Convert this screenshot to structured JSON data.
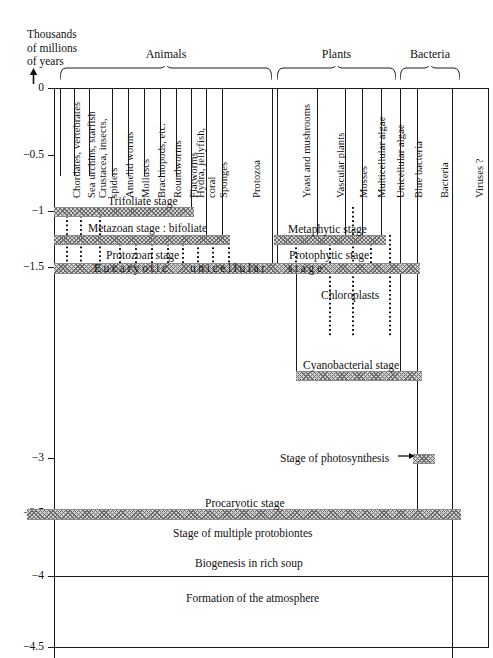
{
  "figure": {
    "axis_caption_lines": [
      "Thousands",
      "of millions",
      "of years"
    ],
    "y_ticks": [
      {
        "label": "0",
        "y": 88
      },
      {
        "label": "−0.5",
        "y": 155
      },
      {
        "label": "−1",
        "y": 211
      },
      {
        "label": "−1.5",
        "y": 267
      },
      {
        "label": "−3",
        "y": 458
      },
      {
        "label": "−3.5",
        "y": 513
      },
      {
        "label": "−4",
        "y": 576
      },
      {
        "label": "−4.5",
        "y": 647
      }
    ],
    "groups": [
      {
        "title": "Animals",
        "left": 60,
        "right": 272
      },
      {
        "title": "Plants",
        "left": 277,
        "right": 396
      },
      {
        "title": "Bacteria",
        "left": 400,
        "right": 460
      }
    ],
    "columns": [
      {
        "label": "Chordates, vertebrates",
        "x0": 60,
        "x1": 74
      },
      {
        "label": "Sea urchins, starfish",
        "x0": 74,
        "x1": 89
      },
      {
        "label": "Crustacea, insects, spiders",
        "x0": 89,
        "x1": 112
      },
      {
        "label": "Annelid worms",
        "x0": 112,
        "x1": 128
      },
      {
        "label": "Molluscs",
        "x0": 128,
        "x1": 144
      },
      {
        "label": "Brachiopods, etc.",
        "x0": 144,
        "x1": 160
      },
      {
        "label": "Roundworms",
        "x0": 160,
        "x1": 176
      },
      {
        "label": "Flatworms",
        "x0": 176,
        "x1": 191
      },
      {
        "label": "Hydra, jellyfish, coral",
        "x0": 191,
        "x1": 206
      },
      {
        "label": "Sponges",
        "x0": 206,
        "x1": 222
      },
      {
        "label": "Protozoa",
        "x0": 222,
        "x1": 272
      },
      {
        "label": "Yeast and mushrooms",
        "x0": 277,
        "x1": 317
      },
      {
        "label": "Vascular plants",
        "x0": 317,
        "x1": 345
      },
      {
        "label": "Mosses",
        "x0": 345,
        "x1": 362
      },
      {
        "label": "Multicellular algae",
        "x0": 362,
        "x1": 381
      },
      {
        "label": "Unicellular algae",
        "x0": 381,
        "x1": 400
      },
      {
        "label": "Blue bacteria",
        "x0": 400,
        "x1": 417
      },
      {
        "label": "Bacteria",
        "x0": 417,
        "x1": 452
      },
      {
        "label": "Viruses ?",
        "x0": 452,
        "x1": 488
      }
    ],
    "bands": [
      {
        "name": "trifoliate-base",
        "left": 54,
        "width": 140,
        "top": 207,
        "height": 8
      },
      {
        "name": "metazoan-base",
        "left": 54,
        "width": 176,
        "top": 235,
        "height": 8
      },
      {
        "name": "metaphytic-base",
        "left": 274,
        "width": 112,
        "top": 235,
        "height": 8
      },
      {
        "name": "eucaryotic-base",
        "left": 54,
        "width": 366,
        "top": 263,
        "height": 9
      },
      {
        "name": "cyanobacterial-base",
        "left": 296,
        "width": 126,
        "top": 371,
        "height": 8
      },
      {
        "name": "photosynthesis-tip",
        "left": 413,
        "width": 22,
        "top": 454,
        "height": 8
      },
      {
        "name": "procaryotic-base",
        "left": 27,
        "width": 434,
        "top": 509,
        "height": 9
      }
    ],
    "stage_labels": [
      {
        "text": "Trifoliate stage",
        "x": 108,
        "y": 195,
        "spaced": false
      },
      {
        "text": "Metazoan stage : bifoliate",
        "x": 88,
        "y": 222,
        "spaced": false
      },
      {
        "text": "Protozoan stage",
        "x": 106,
        "y": 249,
        "spaced": false
      },
      {
        "text": "Eucaryotic",
        "x": 94,
        "y": 262,
        "spaced": true
      },
      {
        "text": "unicellular",
        "x": 190,
        "y": 262,
        "spaced": true
      },
      {
        "text": "stage",
        "x": 288,
        "y": 262,
        "spaced": true
      },
      {
        "text": "Metaphytic stage",
        "x": 288,
        "y": 223,
        "spaced": false
      },
      {
        "text": "Protophytic stage",
        "x": 289,
        "y": 249,
        "spaced": false
      },
      {
        "text": "Chloroplasts",
        "x": 321,
        "y": 289,
        "spaced": false
      },
      {
        "text": "Cyanobacterial stage",
        "x": 303,
        "y": 359,
        "spaced": false
      },
      {
        "text": "Stage of photosynthesis",
        "x": 280,
        "y": 452,
        "spaced": false
      },
      {
        "text": "Procaryotic stage",
        "x": 205,
        "y": 497,
        "spaced": false
      },
      {
        "text": "Stage of multiple protobiontes",
        "x": 173,
        "y": 527,
        "spaced": false
      },
      {
        "text": "Biogenesis in rich soup",
        "x": 195,
        "y": 557,
        "spaced": false
      },
      {
        "text": "Formation of the atmosphere",
        "x": 186,
        "y": 592,
        "spaced": false
      }
    ],
    "lineages": [
      {
        "name": "chordates",
        "x": 67,
        "top": 207,
        "bottom": 272
      },
      {
        "name": "seaurchins",
        "x": 81,
        "top": 207,
        "bottom": 272
      },
      {
        "name": "crustacea",
        "x": 100,
        "top": 207,
        "bottom": 272
      },
      {
        "name": "annelid",
        "x": 120,
        "top": 235,
        "bottom": 272
      },
      {
        "name": "molluscs",
        "x": 136,
        "top": 235,
        "bottom": 272
      },
      {
        "name": "brachiopods",
        "x": 152,
        "top": 235,
        "bottom": 272
      },
      {
        "name": "roundworms",
        "x": 168,
        "top": 235,
        "bottom": 272
      },
      {
        "name": "flatworms",
        "x": 183,
        "top": 235,
        "bottom": 272
      },
      {
        "name": "hydra",
        "x": 198,
        "top": 243,
        "bottom": 272
      },
      {
        "name": "sponges",
        "x": 213,
        "top": 243,
        "bottom": 272
      },
      {
        "name": "protozoa",
        "x": 229,
        "top": 243,
        "bottom": 272
      },
      {
        "name": "yeast",
        "x": 296,
        "top": 243,
        "bottom": 272
      },
      {
        "name": "vascular",
        "x": 330,
        "top": 235,
        "bottom": 272
      },
      {
        "name": "mosses",
        "x": 353,
        "top": 207,
        "bottom": 272
      },
      {
        "name": "multicell-algae",
        "x": 371,
        "top": 235,
        "bottom": 272
      },
      {
        "name": "unicell-algae",
        "x": 390,
        "top": 235,
        "bottom": 272
      },
      {
        "name": "chloro-a",
        "x": 330,
        "top": 272,
        "bottom": 336
      },
      {
        "name": "chloro-b",
        "x": 353,
        "top": 272,
        "bottom": 336
      },
      {
        "name": "chloro-c",
        "x": 390,
        "top": 272,
        "bottom": 336
      }
    ],
    "solid_lineages": [
      {
        "name": "protozoa-solid",
        "x": 272,
        "top": 88,
        "bottom": 272
      },
      {
        "name": "yeast-left-solid",
        "x": 277,
        "top": 88,
        "bottom": 272
      },
      {
        "name": "vascular-solid",
        "x": 317,
        "top": 88,
        "bottom": 243
      },
      {
        "name": "mosses-solid",
        "x": 345,
        "top": 88,
        "bottom": 243
      },
      {
        "name": "multicell-solid",
        "x": 362,
        "top": 88,
        "bottom": 243
      },
      {
        "name": "unicell-left-solid",
        "x": 381,
        "top": 88,
        "bottom": 243
      },
      {
        "name": "bluebact-solid",
        "x": 400,
        "top": 88,
        "bottom": 379
      },
      {
        "name": "cyano-left-solid",
        "x": 296,
        "top": 379,
        "bottom": 272
      },
      {
        "name": "bacteria-solid",
        "x": 417,
        "top": 88,
        "bottom": 513
      },
      {
        "name": "viruses-solid",
        "x": 452,
        "top": 88,
        "bottom": 658
      },
      {
        "name": "col-flatworm-solid",
        "x": 191,
        "top": 88,
        "bottom": 215
      },
      {
        "name": "col-sponge-solid",
        "x": 206,
        "top": 88,
        "bottom": 243
      },
      {
        "name": "col-hydra-solid",
        "x": 222,
        "top": 88,
        "bottom": 243
      }
    ]
  }
}
